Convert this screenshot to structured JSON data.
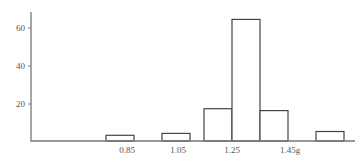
{
  "chart_data": {
    "type": "bar",
    "title": "",
    "xlabel": "",
    "ylabel": "",
    "x_unit": "g",
    "bin_width": 0.1,
    "bins": [
      {
        "start": 0.8,
        "end": 0.9,
        "value": 3
      },
      {
        "start": 1.0,
        "end": 1.1,
        "value": 4
      },
      {
        "start": 1.15,
        "end": 1.25,
        "value": 17
      },
      {
        "start": 1.25,
        "end": 1.35,
        "value": 64
      },
      {
        "start": 1.35,
        "end": 1.45,
        "value": 16
      },
      {
        "start": 1.55,
        "end": 1.65,
        "value": 5
      }
    ],
    "categories": [
      "0.85",
      "1.05",
      "1.20",
      "1.30",
      "1.40",
      "1.60"
    ],
    "values": [
      3,
      4,
      17,
      64,
      16,
      5
    ],
    "x_tick_labels": [
      "0.85",
      "1.05",
      "1.25",
      "1.45g"
    ],
    "y_tick_labels": [
      "20",
      "40",
      "60"
    ],
    "ylim": [
      0,
      70
    ],
    "grid": false,
    "legend": null
  }
}
